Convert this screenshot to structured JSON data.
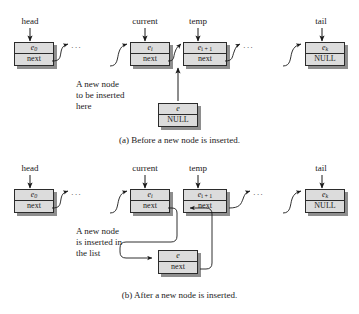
{
  "figure": {
    "ellipsis": "···",
    "colors": {
      "node_fill": "#dcdcdc",
      "node_border": "#2b2b2b",
      "shadow": "#8e8e8e",
      "text": "#1a1a1a",
      "background": "#ffffff"
    }
  },
  "panel_a": {
    "caption": "(a) Before a new node is inserted.",
    "pointers": [
      {
        "name": "head",
        "label": "head"
      },
      {
        "name": "current",
        "label": "current"
      },
      {
        "name": "temp",
        "label": "temp"
      },
      {
        "name": "tail",
        "label": "tail"
      }
    ],
    "nodes": [
      {
        "name": "node-head",
        "element": "e",
        "index": "0",
        "link": "next"
      },
      {
        "name": "node-current",
        "element": "e",
        "index": "i",
        "link": "next"
      },
      {
        "name": "node-temp",
        "element": "e",
        "index": "i + 1",
        "link": "next"
      },
      {
        "name": "node-tail",
        "element": "e",
        "index": "k",
        "link": "NULL"
      },
      {
        "name": "node-new",
        "element": "e",
        "index": "",
        "link": "NULL"
      }
    ],
    "annotation": {
      "line1": "A new node",
      "line2": "to be inserted",
      "line3": "here"
    }
  },
  "panel_b": {
    "caption": "(b) After a new node is inserted.",
    "pointers": [
      {
        "name": "head",
        "label": "head"
      },
      {
        "name": "current",
        "label": "current"
      },
      {
        "name": "temp",
        "label": "temp"
      },
      {
        "name": "tail",
        "label": "tail"
      }
    ],
    "nodes": [
      {
        "name": "node-head",
        "element": "e",
        "index": "0",
        "link": "next"
      },
      {
        "name": "node-current",
        "element": "e",
        "index": "i",
        "link": "next"
      },
      {
        "name": "node-temp",
        "element": "e",
        "index": "i + 1",
        "link": "next"
      },
      {
        "name": "node-tail",
        "element": "e",
        "index": "k",
        "link": "NULL"
      },
      {
        "name": "node-new",
        "element": "e",
        "index": "",
        "link": "next"
      }
    ],
    "annotation": {
      "line1": "A new node",
      "line2": "is inserted in",
      "line3": "the list"
    }
  }
}
